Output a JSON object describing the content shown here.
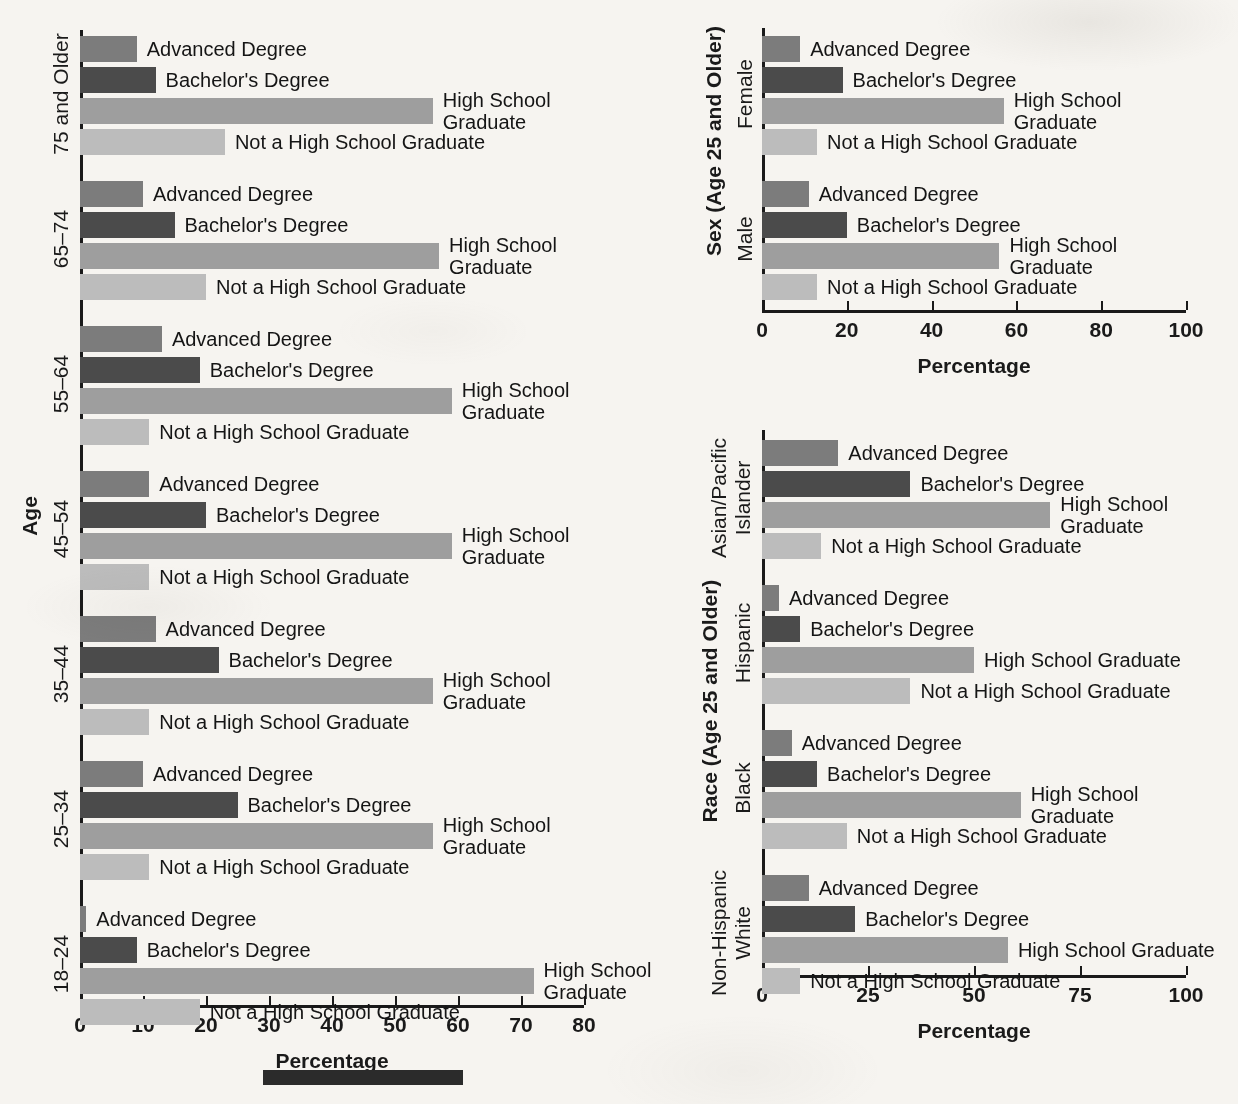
{
  "series": [
    {
      "key": "advanced",
      "label": "Advanced Degree",
      "color": "#7c7c7c"
    },
    {
      "key": "bachelors",
      "label": "Bachelor's Degree",
      "color": "#4b4b4b"
    },
    {
      "key": "hs_grad",
      "label": "High School Graduate",
      "color": "#9e9e9e"
    },
    {
      "key": "not_hs",
      "label": "Not a High School Graduate",
      "color": "#bcbcbc"
    }
  ],
  "axis_label_percentage": "Percentage",
  "chart_data": [
    {
      "id": "age",
      "type": "bar",
      "orientation": "horizontal",
      "title": "",
      "ylabel": "Age",
      "xlabel": "Percentage",
      "xlim": [
        0,
        80
      ],
      "xticks": [
        0,
        10,
        20,
        30,
        40,
        50,
        60,
        70,
        80
      ],
      "grid": false,
      "legend": "inline-labels",
      "categories": [
        "75 and Older",
        "65–74",
        "55–64",
        "45–54",
        "35–44",
        "25–34",
        "18–24"
      ],
      "series": [
        {
          "name": "Advanced Degree",
          "values": [
            9,
            10,
            13,
            11,
            12,
            10,
            1
          ]
        },
        {
          "name": "Bachelor's Degree",
          "values": [
            12,
            15,
            19,
            20,
            22,
            25,
            9
          ]
        },
        {
          "name": "High School Graduate",
          "values": [
            56,
            57,
            59,
            59,
            56,
            56,
            72
          ]
        },
        {
          "name": "Not a High School Graduate",
          "values": [
            23,
            20,
            11,
            11,
            11,
            11,
            19
          ]
        }
      ],
      "label_wrap": {
        "75 and Older": {
          "High School Graduate": true
        },
        "65–74": {
          "High School Graduate": true
        },
        "55–64": {
          "High School Graduate": true
        },
        "45–54": {
          "High School Graduate": true
        },
        "35–44": {
          "High School Graduate": true
        },
        "25–34": {
          "High School Graduate": true
        },
        "18–24": {
          "High School Graduate": true
        }
      }
    },
    {
      "id": "sex",
      "type": "bar",
      "orientation": "horizontal",
      "title": "",
      "ylabel": "Sex (Age 25 and Older)",
      "xlabel": "Percentage",
      "xlim": [
        0,
        100
      ],
      "xticks": [
        0,
        20,
        40,
        60,
        80,
        100
      ],
      "grid": false,
      "legend": "inline-labels",
      "categories": [
        "Female",
        "Male"
      ],
      "series": [
        {
          "name": "Advanced Degree",
          "values": [
            9,
            11
          ]
        },
        {
          "name": "Bachelor's Degree",
          "values": [
            19,
            20
          ]
        },
        {
          "name": "High School Graduate",
          "values": [
            57,
            56
          ]
        },
        {
          "name": "Not a High School Graduate",
          "values": [
            13,
            13
          ]
        }
      ],
      "label_wrap": {
        "Female": {
          "High School Graduate": true
        },
        "Male": {
          "High School Graduate": true
        }
      }
    },
    {
      "id": "race",
      "type": "bar",
      "orientation": "horizontal",
      "title": "",
      "ylabel": "Race (Age 25 and Older)",
      "xlabel": "Percentage",
      "xlim": [
        0,
        100
      ],
      "xticks": [
        0,
        25,
        50,
        75,
        100
      ],
      "grid": false,
      "legend": "inline-labels",
      "categories": [
        "Asian/Pacific Islander",
        "Hispanic",
        "Black",
        "Non-Hispanic White"
      ],
      "series": [
        {
          "name": "Advanced Degree",
          "values": [
            18,
            4,
            7,
            11
          ]
        },
        {
          "name": "Bachelor's Degree",
          "values": [
            35,
            9,
            13,
            22
          ]
        },
        {
          "name": "High School Graduate",
          "values": [
            68,
            50,
            61,
            58
          ]
        },
        {
          "name": "Not a High School Graduate",
          "values": [
            14,
            35,
            20,
            9
          ]
        }
      ],
      "label_wrap": {
        "Asian/Pacific Islander": {
          "High School Graduate": true
        },
        "Black": {
          "High School Graduate": true
        }
      }
    }
  ]
}
